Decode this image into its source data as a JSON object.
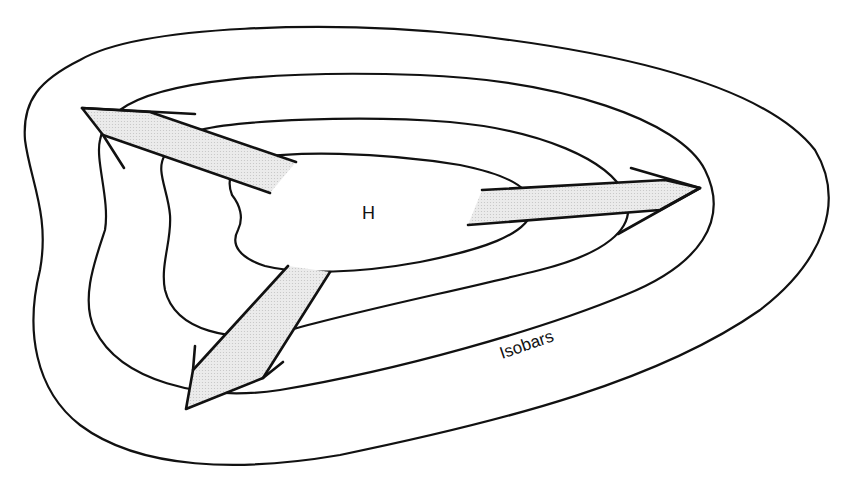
{
  "diagram": {
    "center_label": "H",
    "isobar_label": "Isobars",
    "isobar_count": 4,
    "arrow_count": 3,
    "colors": {
      "line": "#111111",
      "arrow_fill": "#e4e4e4",
      "background": "#ffffff"
    }
  }
}
